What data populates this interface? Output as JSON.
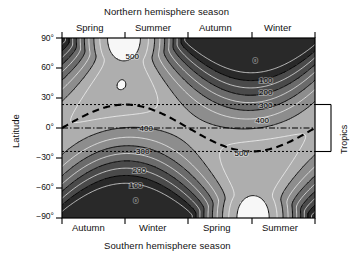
{
  "axes": {
    "top_title": "Northern hemisphere season",
    "bottom_title": "Southern hemisphere season",
    "y_title": "Latitude",
    "right_title": "Tropics",
    "north_seasons": [
      "Spring",
      "Summer",
      "Autumn",
      "Winter"
    ],
    "south_seasons": [
      "Autumn",
      "Winter",
      "Spring",
      "Summer"
    ],
    "y_ticks": [
      "90°",
      "60°",
      "30°",
      "0°",
      "−30°",
      "−60°",
      "−90°"
    ]
  },
  "chart_data": {
    "type": "heatmap",
    "title": "",
    "subtitle": "",
    "xlabel": "Northern hemisphere season",
    "ylabel": "Latitude",
    "xlabel_secondary": "Southern hemisphere season",
    "grid": false,
    "legend": "none",
    "x": [
      0,
      90,
      180,
      270,
      360
    ],
    "x_tick_labels": [
      "Spring",
      "Summer",
      "Autumn",
      "Winter"
    ],
    "x_tick_labels_secondary": [
      "Autumn",
      "Winter",
      "Spring",
      "Summer"
    ],
    "xlim": [
      0,
      360
    ],
    "ylim": [
      -90,
      90
    ],
    "y_ticks": [
      90,
      60,
      30,
      0,
      -30,
      -60,
      -90
    ],
    "y_tick_labels": [
      "90°",
      "60°",
      "30°",
      "0°",
      "−30°",
      "−60°",
      "−90°"
    ],
    "zlabel": "Daily insolation (W m⁻²)",
    "contour_levels": [
      0,
      100,
      200,
      300,
      400,
      500
    ],
    "contour_labels": [
      "0",
      "100",
      "200",
      "300",
      "400",
      "500"
    ],
    "z_min": 0,
    "z_max": 550,
    "shading": "grayscale: black = 0, light gray = maximum",
    "annotations": [
      {
        "text": "500",
        "x": 100,
        "y": 72,
        "note": "northern summer polar maximum lobe"
      },
      {
        "text": "0",
        "x": 275,
        "y": 68,
        "note": "northern winter polar night"
      },
      {
        "text": "100",
        "x": 290,
        "y": 48
      },
      {
        "text": "200",
        "x": 290,
        "y": 36
      },
      {
        "text": "300",
        "x": 290,
        "y": 23
      },
      {
        "text": "400",
        "x": 285,
        "y": 8
      },
      {
        "text": "400",
        "x": 120,
        "y": 0,
        "note": "equatorial band"
      },
      {
        "text": "300",
        "x": 115,
        "y": -23
      },
      {
        "text": "200",
        "x": 110,
        "y": -42
      },
      {
        "text": "100",
        "x": 105,
        "y": -57
      },
      {
        "text": "0",
        "x": 105,
        "y": -72,
        "note": "southern winter polar night"
      },
      {
        "text": "500",
        "x": 255,
        "y": -25,
        "note": "southern summer maximum lobe"
      }
    ],
    "reference_lines": [
      {
        "name": "tropic-of-cancer",
        "y": 23.5,
        "style": "dotted"
      },
      {
        "name": "equator",
        "y": 0,
        "style": "dash-dot"
      },
      {
        "name": "tropic-of-capricorn",
        "y": -23.5,
        "style": "dotted"
      },
      {
        "name": "subsolar-latitude",
        "style": "thick-dashed",
        "description": "declination of the Sun through the year, ranging ±23.5°"
      }
    ],
    "subsolar_latitude_series": {
      "name": "Subsolar latitude",
      "x": [
        0,
        45,
        90,
        135,
        180,
        225,
        270,
        315,
        360
      ],
      "values": [
        0,
        16.6,
        23.5,
        16.6,
        0,
        -16.6,
        -23.5,
        -16.6,
        0
      ]
    },
    "series": [
      {
        "name": "insolation at 90°N",
        "x": [
          0,
          45,
          90,
          135,
          180,
          225,
          270,
          315,
          360
        ],
        "values": [
          220,
          430,
          520,
          430,
          215,
          20,
          0,
          15,
          220
        ]
      },
      {
        "name": "insolation at 60°N",
        "x": [
          0,
          45,
          90,
          135,
          180,
          225,
          270,
          315,
          360
        ],
        "values": [
          300,
          440,
          490,
          445,
          300,
          140,
          70,
          140,
          300
        ]
      },
      {
        "name": "insolation at 30°N",
        "x": [
          0,
          45,
          90,
          135,
          180,
          225,
          270,
          315,
          360
        ],
        "values": [
          400,
          470,
          490,
          470,
          400,
          300,
          250,
          300,
          400
        ]
      },
      {
        "name": "insolation at 0°",
        "x": [
          0,
          45,
          90,
          135,
          180,
          225,
          270,
          315,
          360
        ],
        "values": [
          430,
          410,
          380,
          410,
          430,
          410,
          390,
          410,
          430
        ]
      },
      {
        "name": "insolation at 30°S",
        "x": [
          0,
          45,
          90,
          135,
          180,
          225,
          270,
          315,
          360
        ],
        "values": [
          400,
          300,
          250,
          300,
          400,
          480,
          520,
          480,
          400
        ]
      },
      {
        "name": "insolation at 60°S",
        "x": [
          0,
          45,
          90,
          135,
          180,
          225,
          270,
          315,
          360
        ],
        "values": [
          300,
          140,
          70,
          140,
          300,
          460,
          520,
          460,
          300
        ]
      },
      {
        "name": "insolation at 90°S",
        "x": [
          0,
          45,
          90,
          135,
          180,
          225,
          270,
          315,
          360
        ],
        "values": [
          220,
          15,
          0,
          20,
          215,
          480,
          560,
          480,
          220
        ]
      }
    ]
  }
}
